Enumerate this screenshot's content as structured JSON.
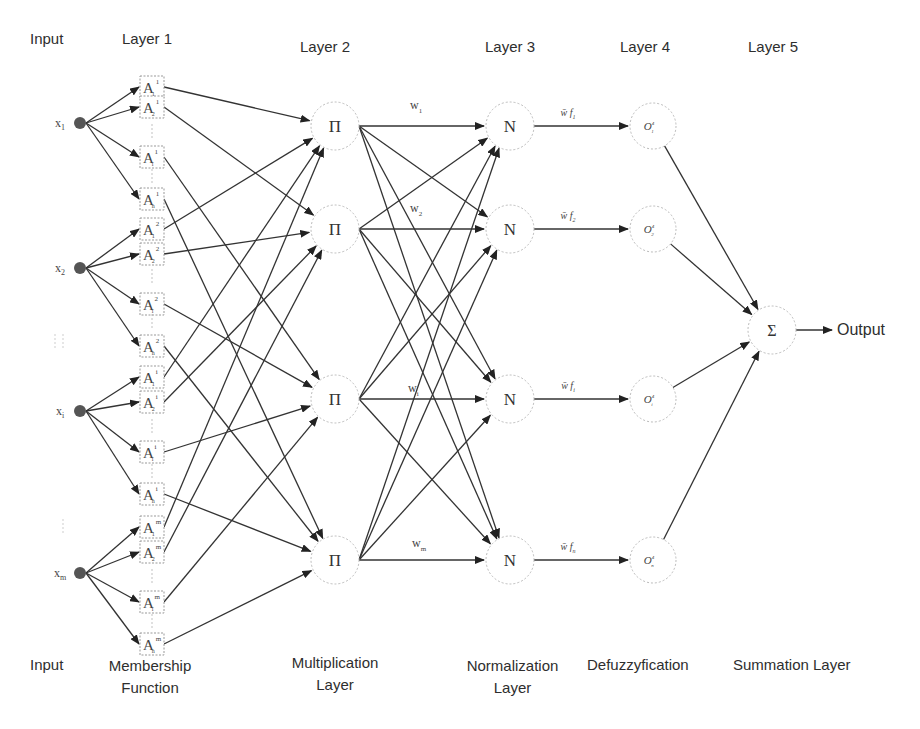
{
  "headers": {
    "input": "Input",
    "layer1": "Layer 1",
    "layer2": "Layer 2",
    "layer3": "Layer 3",
    "layer4": "Layer 4",
    "layer5": "Layer 5"
  },
  "footers": {
    "input": "Input",
    "membership_line1": "Membership",
    "membership_line2": "Function",
    "multiplication_line1": "Multiplication",
    "multiplication_line2": "Layer",
    "normalization_line1": "Normalization",
    "normalization_line2": "Layer",
    "defuzzification": "Defuzzyfication",
    "summation": "Summation Layer"
  },
  "inputs": [
    {
      "label": "x",
      "sub": "1"
    },
    {
      "label": "x",
      "sub": "2"
    },
    {
      "label": "x",
      "sub": "i"
    },
    {
      "label": "x",
      "sub": "m"
    }
  ],
  "membership_functions": [
    {
      "label": "A",
      "sub": "1",
      "sup": "1"
    },
    {
      "label": "A",
      "sub": "2",
      "sup": "1"
    },
    {
      "label": "A",
      "sub": "i",
      "sup": "1"
    },
    {
      "label": "A",
      "sub": "n",
      "sup": "1"
    },
    {
      "label": "A",
      "sub": "1",
      "sup": "2"
    },
    {
      "label": "A",
      "sub": "2",
      "sup": "2"
    },
    {
      "label": "A",
      "sub": "i",
      "sup": "2"
    },
    {
      "label": "A",
      "sub": "n",
      "sup": "2"
    },
    {
      "label": "A",
      "sub": "1",
      "sup": "i"
    },
    {
      "label": "A",
      "sub": "2",
      "sup": "i"
    },
    {
      "label": "A",
      "sub": "i",
      "sup": "i"
    },
    {
      "label": "A",
      "sub": "n",
      "sup": "i"
    },
    {
      "label": "A",
      "sub": "1",
      "sup": "m"
    },
    {
      "label": "A",
      "sub": "2",
      "sup": "m"
    },
    {
      "label": "A",
      "sub": "i",
      "sup": "m"
    },
    {
      "label": "A",
      "sub": "n",
      "sup": "m"
    }
  ],
  "product_nodes": [
    {
      "symbol": "Π",
      "weight": "w",
      "weight_sub": "1"
    },
    {
      "symbol": "Π",
      "weight": "w",
      "weight_sub": "2"
    },
    {
      "symbol": "Π",
      "weight": "w",
      "weight_sub": "i"
    },
    {
      "symbol": "Π",
      "weight": "w",
      "weight_sub": "m"
    }
  ],
  "normalization_nodes": [
    {
      "symbol": "N",
      "edge_label": "w̄ f",
      "edge_sub": "1"
    },
    {
      "symbol": "N",
      "edge_label": "w̄ f",
      "edge_sub": "2"
    },
    {
      "symbol": "N",
      "edge_label": "w̄ f",
      "edge_sub": "i"
    },
    {
      "symbol": "N",
      "edge_label": "w̄ f",
      "edge_sub": "n"
    }
  ],
  "defuzz_nodes": [
    {
      "symbol": "O",
      "sup": "4",
      "sub": "1"
    },
    {
      "symbol": "O",
      "sup": "4",
      "sub": "2"
    },
    {
      "symbol": "O",
      "sup": "4",
      "sub": "i"
    },
    {
      "symbol": "O",
      "sup": "4",
      "sub": "n"
    }
  ],
  "summation_node": {
    "symbol": "Σ"
  },
  "output_label": "Output"
}
